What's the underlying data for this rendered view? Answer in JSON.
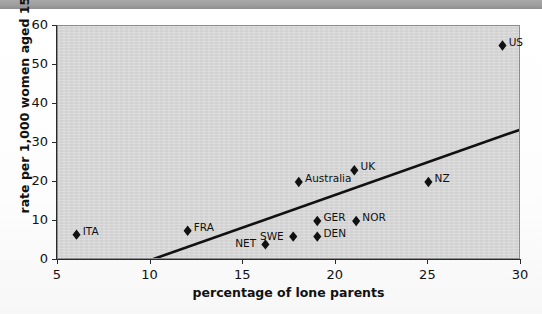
{
  "topbar": {
    "partial_text": ""
  },
  "chart_data": {
    "type": "scatter",
    "title": "",
    "xlabel": "percentage of lone parents",
    "ylabel": "rate per 1,000 women aged 15–19",
    "xlim": [
      5,
      30
    ],
    "ylim": [
      0,
      60
    ],
    "xticks": [
      "5",
      "10",
      "15",
      "20",
      "25",
      "30"
    ],
    "yticks": [
      "0",
      "10",
      "20",
      "30",
      "40",
      "50",
      "60"
    ],
    "grid": false,
    "legend": "none",
    "marker": "diamond",
    "points": [
      {
        "label": "ITA",
        "x": 6.0,
        "y": 6.5,
        "label_pos": "right"
      },
      {
        "label": "FRA",
        "x": 12.0,
        "y": 7.5,
        "label_pos": "right"
      },
      {
        "label": "NET",
        "x": 16.2,
        "y": 4.0,
        "label_pos": "left"
      },
      {
        "label": "SWE",
        "x": 17.7,
        "y": 6.0,
        "label_pos": "left"
      },
      {
        "label": "Australia",
        "x": 18.0,
        "y": 20.0,
        "label_pos": "right"
      },
      {
        "label": "DEN",
        "x": 19.0,
        "y": 6.0,
        "label_pos": "right"
      },
      {
        "label": "GER",
        "x": 19.0,
        "y": 10.0,
        "label_pos": "right"
      },
      {
        "label": "UK",
        "x": 21.0,
        "y": 23.0,
        "label_pos": "right"
      },
      {
        "label": "NOR",
        "x": 21.1,
        "y": 10.0,
        "label_pos": "right"
      },
      {
        "label": "NZ",
        "x": 25.0,
        "y": 20.0,
        "label_pos": "right"
      },
      {
        "label": "US",
        "x": 29.0,
        "y": 55.0,
        "label_pos": "right"
      }
    ],
    "trendline": {
      "x0": 10.0,
      "y0": 0.0,
      "x1": 30.0,
      "y1": 33.5
    }
  }
}
